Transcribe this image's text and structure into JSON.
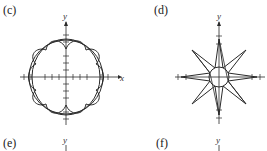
{
  "panels": [
    {
      "id": "c",
      "label": "(c)",
      "x_axis": "x",
      "y_axis": "y",
      "description": "Circle with eight-petal rosette (two overlapping circles and scalloped curve)"
    },
    {
      "id": "d",
      "label": "(d)",
      "x_axis": "x",
      "y_axis": "y",
      "description": "Eight-pointed star with small inner circle"
    },
    {
      "id": "e",
      "label": "(e)",
      "y_axis": "y"
    },
    {
      "id": "f",
      "label": "(f)",
      "y_axis": "y"
    }
  ]
}
